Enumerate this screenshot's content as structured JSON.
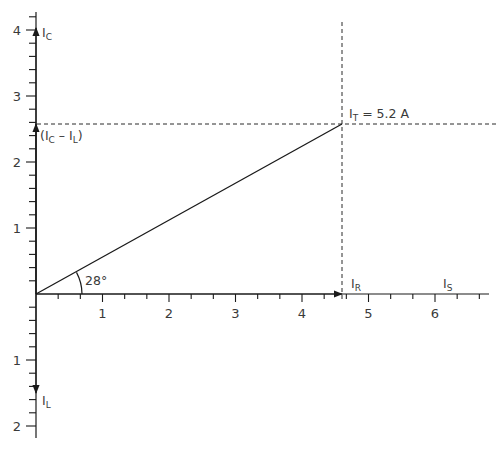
{
  "diagram": {
    "type": "phasor-diagram",
    "colors": {
      "axis": "#1a1a1a",
      "text": "#3a3a3a",
      "dash": "#2a2a2a",
      "background": "#ffffff"
    },
    "x_axis": {
      "tick_labels": [
        "1",
        "2",
        "3",
        "4",
        "5",
        "6"
      ],
      "range": [
        0,
        6.8
      ],
      "minor_ticks_per_unit": 3
    },
    "y_axis": {
      "positive_tick_labels": [
        "1",
        "2",
        "3",
        "4"
      ],
      "negative_tick_labels": [
        "1",
        "2"
      ],
      "range": [
        -2.2,
        4.2
      ],
      "minor_ticks_per_unit": 5
    },
    "vectors": [
      {
        "id": "IC",
        "main": "I",
        "sub": "C",
        "direction": "up",
        "magnitude": 4.0
      },
      {
        "id": "IC_minus_IL",
        "prefix": "(I",
        "sub1": "C",
        "mid": " – I",
        "sub2": "L",
        "suffix": ")",
        "direction": "up",
        "magnitude": 2.57
      },
      {
        "id": "IL",
        "main": "I",
        "sub": "L",
        "direction": "down",
        "magnitude": 1.5
      },
      {
        "id": "IR",
        "main": "I",
        "sub": "R",
        "direction": "right",
        "magnitude": 4.6
      },
      {
        "id": "IS",
        "main": "I",
        "sub": "S",
        "direction": "right-label-only"
      },
      {
        "id": "IT",
        "main": "I",
        "sub": "T",
        "suffix": " = 5.2 A",
        "x": 4.6,
        "y": 2.57
      }
    ],
    "angle": {
      "label": "28°",
      "value_deg": 28
    }
  }
}
